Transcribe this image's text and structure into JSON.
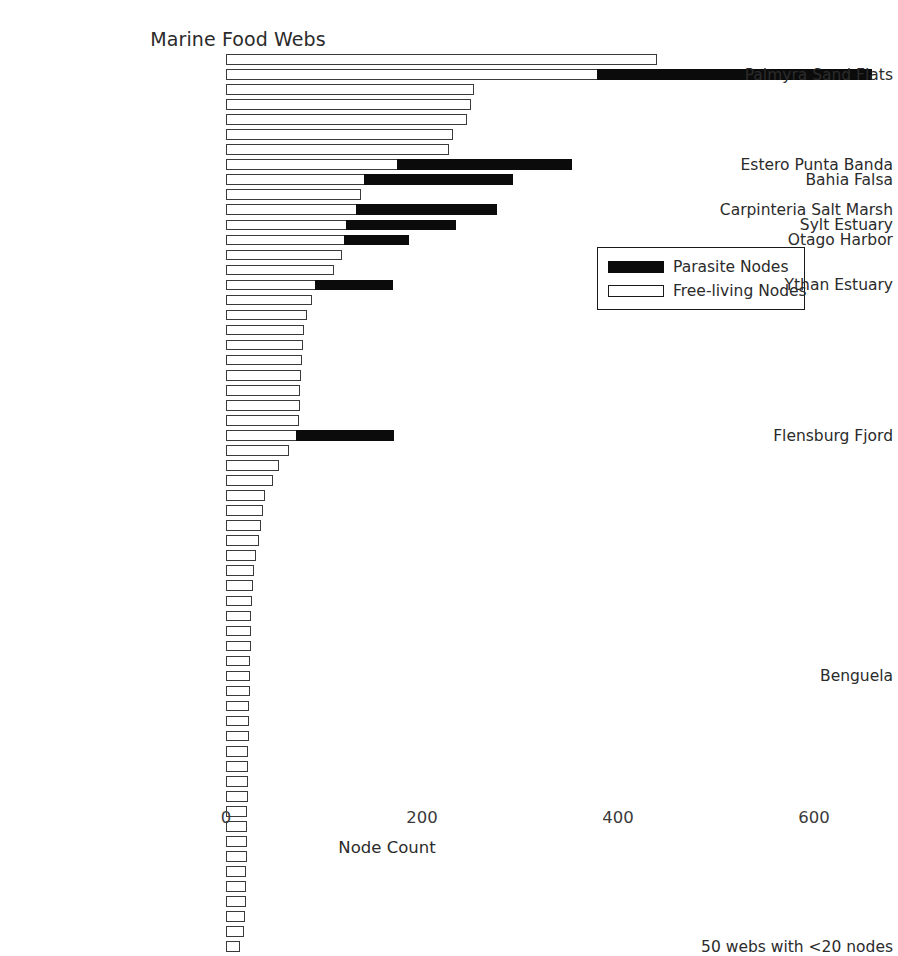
{
  "chart_data": {
    "type": "bar",
    "orientation": "horizontal",
    "stacked": true,
    "title": "Marine Food Webs",
    "xlabel": "Node Count",
    "ylabel": "",
    "xlim": [
      0,
      680
    ],
    "grid": false,
    "legend_position": "center-right",
    "xticks": [
      {
        "value": 0,
        "label": "0"
      },
      {
        "value": 200,
        "label": "200"
      },
      {
        "value": 400,
        "label": "400"
      },
      {
        "value": 600,
        "label": "600"
      }
    ],
    "series": [
      {
        "name": "Free-living Nodes",
        "color": "#ffffff",
        "edge": "#3a3a3a"
      },
      {
        "name": "Parasite Nodes",
        "color": "#0b0b0b",
        "edge": "#0b0b0b"
      }
    ],
    "bars": [
      {
        "label": "",
        "free": 440,
        "parasite": 0
      },
      {
        "label": "Palmyra Sand Flats",
        "free": 380,
        "parasite": 280
      },
      {
        "label": "",
        "free": 253,
        "parasite": 0
      },
      {
        "label": "",
        "free": 250,
        "parasite": 0
      },
      {
        "label": "",
        "free": 246,
        "parasite": 0
      },
      {
        "label": "",
        "free": 232,
        "parasite": 0
      },
      {
        "label": "",
        "free": 228,
        "parasite": 0
      },
      {
        "label": "Estero Punta Banda",
        "free": 176,
        "parasite": 178
      },
      {
        "label": "Bahia Falsa",
        "free": 142,
        "parasite": 152
      },
      {
        "label": "",
        "free": 138,
        "parasite": 0
      },
      {
        "label": "Carpinteria Salt Marsh",
        "free": 134,
        "parasite": 144
      },
      {
        "label": "Sylt Estuary",
        "free": 124,
        "parasite": 112
      },
      {
        "label": "Otago Harbor",
        "free": 122,
        "parasite": 66
      },
      {
        "label": "",
        "free": 118,
        "parasite": 0
      },
      {
        "label": "",
        "free": 110,
        "parasite": 0
      },
      {
        "label": "Ythan Estuary",
        "free": 92,
        "parasite": 80
      },
      {
        "label": "",
        "free": 88,
        "parasite": 0
      },
      {
        "label": "",
        "free": 83,
        "parasite": 0
      },
      {
        "label": "",
        "free": 80,
        "parasite": 0
      },
      {
        "label": "",
        "free": 79,
        "parasite": 0
      },
      {
        "label": "",
        "free": 78,
        "parasite": 0
      },
      {
        "label": "",
        "free": 77,
        "parasite": 0
      },
      {
        "label": "",
        "free": 76,
        "parasite": 0
      },
      {
        "label": "",
        "free": 75,
        "parasite": 0
      },
      {
        "label": "",
        "free": 74,
        "parasite": 0
      },
      {
        "label": "Flensburg Fjord",
        "free": 73,
        "parasite": 100
      },
      {
        "label": "",
        "free": 64,
        "parasite": 0
      },
      {
        "label": "",
        "free": 54,
        "parasite": 0
      },
      {
        "label": "",
        "free": 48,
        "parasite": 0
      },
      {
        "label": "",
        "free": 40,
        "parasite": 0
      },
      {
        "label": "",
        "free": 38,
        "parasite": 0
      },
      {
        "label": "",
        "free": 36,
        "parasite": 0
      },
      {
        "label": "",
        "free": 34,
        "parasite": 0
      },
      {
        "label": "",
        "free": 31,
        "parasite": 0
      },
      {
        "label": "",
        "free": 29,
        "parasite": 0
      },
      {
        "label": "",
        "free": 28,
        "parasite": 0
      },
      {
        "label": "",
        "free": 27,
        "parasite": 0
      },
      {
        "label": "",
        "free": 26,
        "parasite": 0
      },
      {
        "label": "",
        "free": 25,
        "parasite": 0
      },
      {
        "label": "",
        "free": 25,
        "parasite": 0
      },
      {
        "label": "",
        "free": 24,
        "parasite": 0
      },
      {
        "label": "Benguela",
        "free": 24,
        "parasite": 0
      },
      {
        "label": "",
        "free": 24,
        "parasite": 0
      },
      {
        "label": "",
        "free": 23,
        "parasite": 0
      },
      {
        "label": "",
        "free": 23,
        "parasite": 0
      },
      {
        "label": "",
        "free": 23,
        "parasite": 0
      },
      {
        "label": "",
        "free": 22,
        "parasite": 0
      },
      {
        "label": "",
        "free": 22,
        "parasite": 0
      },
      {
        "label": "",
        "free": 22,
        "parasite": 0
      },
      {
        "label": "",
        "free": 22,
        "parasite": 0
      },
      {
        "label": "",
        "free": 21,
        "parasite": 0
      },
      {
        "label": "",
        "free": 21,
        "parasite": 0
      },
      {
        "label": "",
        "free": 21,
        "parasite": 0
      },
      {
        "label": "",
        "free": 21,
        "parasite": 0
      },
      {
        "label": "",
        "free": 20,
        "parasite": 0
      },
      {
        "label": "",
        "free": 20,
        "parasite": 0
      },
      {
        "label": "",
        "free": 20,
        "parasite": 0
      },
      {
        "label": "",
        "free": 19,
        "parasite": 0
      },
      {
        "label": "",
        "free": 18,
        "parasite": 0
      },
      {
        "label": "50 webs with <20 nodes",
        "free": 14,
        "parasite": 0
      }
    ]
  },
  "legend": {
    "items": [
      {
        "label": "Parasite Nodes",
        "style": "para"
      },
      {
        "label": "Free-living Nodes",
        "style": "free"
      }
    ]
  }
}
